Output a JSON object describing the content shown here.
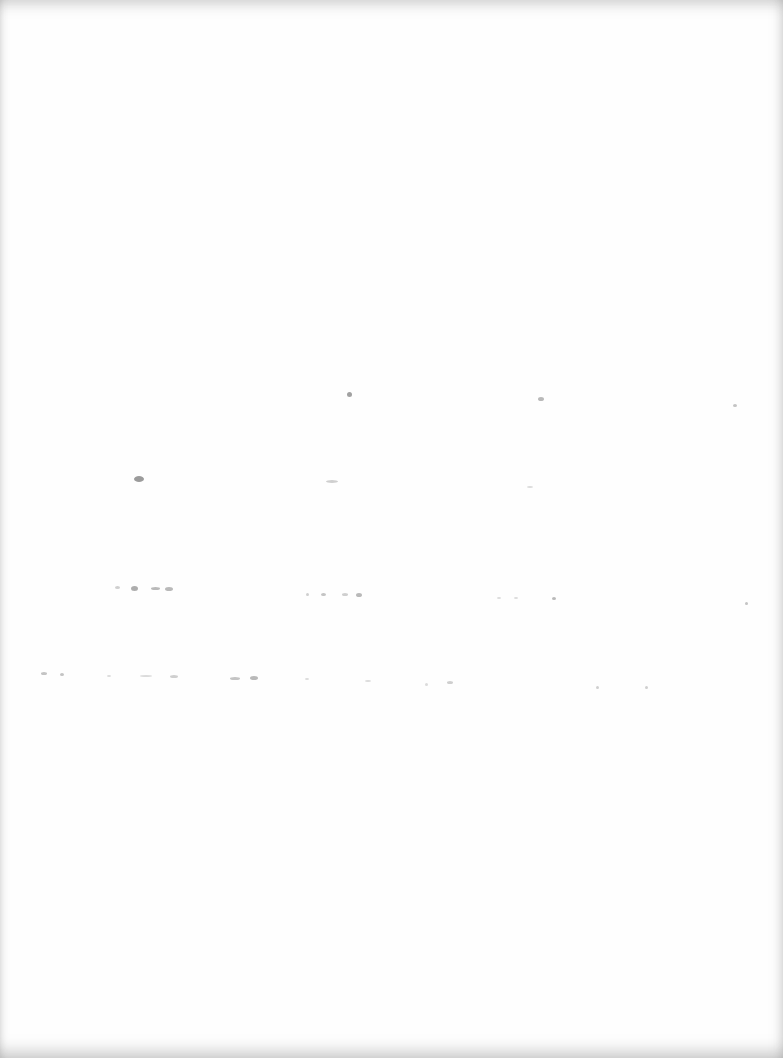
{
  "page": {
    "type": "blank scanned page",
    "background": "#fefefe",
    "speck_color": "#8a8a8a",
    "specks": [
      {
        "x": 347,
        "y": 392,
        "w": 5,
        "h": 5,
        "o": 0.8
      },
      {
        "x": 538,
        "y": 397,
        "w": 6,
        "h": 4,
        "o": 0.6
      },
      {
        "x": 733,
        "y": 404,
        "w": 4,
        "h": 3,
        "o": 0.5
      },
      {
        "x": 134,
        "y": 476,
        "w": 10,
        "h": 6,
        "o": 0.85
      },
      {
        "x": 326,
        "y": 480,
        "w": 12,
        "h": 3,
        "o": 0.4
      },
      {
        "x": 527,
        "y": 486,
        "w": 6,
        "h": 2,
        "o": 0.3
      },
      {
        "x": 115,
        "y": 586,
        "w": 5,
        "h": 3,
        "o": 0.4
      },
      {
        "x": 131,
        "y": 586,
        "w": 7,
        "h": 5,
        "o": 0.7
      },
      {
        "x": 151,
        "y": 587,
        "w": 9,
        "h": 3,
        "o": 0.6
      },
      {
        "x": 165,
        "y": 587,
        "w": 8,
        "h": 4,
        "o": 0.6
      },
      {
        "x": 306,
        "y": 593,
        "w": 3,
        "h": 3,
        "o": 0.4
      },
      {
        "x": 321,
        "y": 593,
        "w": 5,
        "h": 3,
        "o": 0.5
      },
      {
        "x": 342,
        "y": 593,
        "w": 6,
        "h": 3,
        "o": 0.4
      },
      {
        "x": 356,
        "y": 593,
        "w": 6,
        "h": 4,
        "o": 0.6
      },
      {
        "x": 497,
        "y": 597,
        "w": 4,
        "h": 2,
        "o": 0.3
      },
      {
        "x": 514,
        "y": 597,
        "w": 4,
        "h": 2,
        "o": 0.3
      },
      {
        "x": 552,
        "y": 597,
        "w": 4,
        "h": 3,
        "o": 0.6
      },
      {
        "x": 745,
        "y": 602,
        "w": 3,
        "h": 3,
        "o": 0.5
      },
      {
        "x": 41,
        "y": 672,
        "w": 6,
        "h": 3,
        "o": 0.5
      },
      {
        "x": 60,
        "y": 673,
        "w": 4,
        "h": 3,
        "o": 0.5
      },
      {
        "x": 107,
        "y": 675,
        "w": 4,
        "h": 2,
        "o": 0.3
      },
      {
        "x": 140,
        "y": 675,
        "w": 12,
        "h": 2,
        "o": 0.3
      },
      {
        "x": 170,
        "y": 675,
        "w": 8,
        "h": 3,
        "o": 0.4
      },
      {
        "x": 230,
        "y": 677,
        "w": 10,
        "h": 3,
        "o": 0.5
      },
      {
        "x": 250,
        "y": 676,
        "w": 8,
        "h": 4,
        "o": 0.6
      },
      {
        "x": 305,
        "y": 678,
        "w": 4,
        "h": 2,
        "o": 0.3
      },
      {
        "x": 365,
        "y": 680,
        "w": 6,
        "h": 2,
        "o": 0.3
      },
      {
        "x": 425,
        "y": 683,
        "w": 3,
        "h": 3,
        "o": 0.3
      },
      {
        "x": 447,
        "y": 681,
        "w": 6,
        "h": 3,
        "o": 0.4
      },
      {
        "x": 596,
        "y": 686,
        "w": 3,
        "h": 3,
        "o": 0.4
      },
      {
        "x": 645,
        "y": 686,
        "w": 3,
        "h": 3,
        "o": 0.4
      }
    ]
  }
}
